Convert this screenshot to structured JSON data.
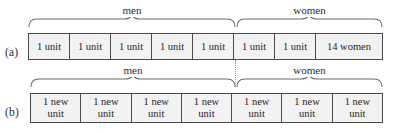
{
  "figure": {
    "rows": [
      {
        "id": "a",
        "label": "(a)",
        "groups": [
          {
            "name": "men",
            "caption": "men"
          },
          {
            "name": "women",
            "caption": "women"
          }
        ],
        "cells": [
          {
            "text": "1 unit"
          },
          {
            "text": "1 unit"
          },
          {
            "text": "1 unit"
          },
          {
            "text": "1 unit"
          },
          {
            "text": "1 unit"
          },
          {
            "text": "1 unit"
          },
          {
            "text": "1 unit"
          },
          {
            "text": "14 women"
          }
        ]
      },
      {
        "id": "b",
        "label": "(b)",
        "groups": [
          {
            "name": "men",
            "caption": "men"
          },
          {
            "name": "women",
            "caption": "women"
          }
        ],
        "cells": [
          {
            "text": "1 new\nunit"
          },
          {
            "text": "1 new\nunit"
          },
          {
            "text": "1 new\nunit"
          },
          {
            "text": "1 new\nunit"
          },
          {
            "text": "1 new\nunit"
          },
          {
            "text": "1 new\nunit"
          },
          {
            "text": "1 new\nunit"
          }
        ]
      }
    ],
    "colors": {
      "cell_fill": "#f2f2f2",
      "cell_border": "#4a4a4a",
      "text": "#1f1f1f",
      "brace": "#6b6b6b",
      "divider": "#9a9a9a",
      "background": "#ffffff"
    }
  }
}
